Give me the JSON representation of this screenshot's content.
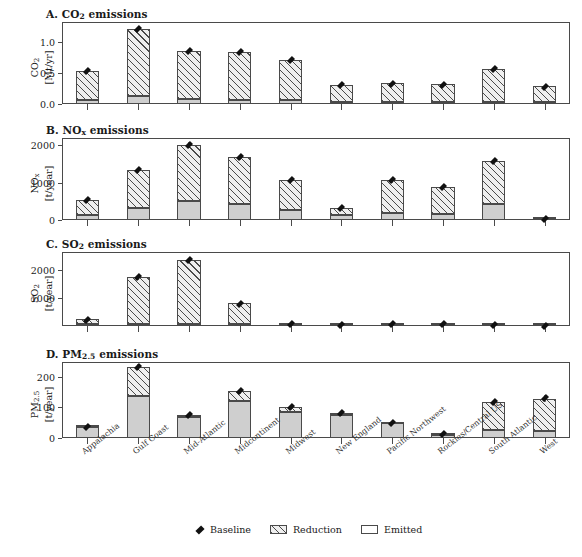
{
  "figure": {
    "categories": [
      "Appalachia",
      "Gulf Coast",
      "Mid-Atlantic",
      "Midcontinent",
      "Midwest",
      "New England",
      "Pacific Northwest",
      "Rockies/Central US",
      "South Atlantic",
      "West"
    ],
    "legend": {
      "baseline_label": "Baseline",
      "reduction_label": "Reduction",
      "emitted_label": "Emitted"
    },
    "colors": {
      "emitted": "#cfcfcf",
      "reduction_hatch": "#4a4a4a",
      "baseline_marker": "#111111",
      "axis": "#4a4a4a"
    }
  },
  "chart_data": [
    {
      "type": "bar",
      "panel": "A",
      "title_prefix": "A.",
      "title_species": "CO",
      "title_species_sub": "2",
      "title_suffix": "emissions",
      "ylabel_species": "CO",
      "ylabel_species_sub": "2",
      "ylabel_units": "[Mt/yr]",
      "categories": [
        "Appalachia",
        "Gulf Coast",
        "Mid-Atlantic",
        "Midcontinent",
        "Midwest",
        "New England",
        "Pacific Northwest",
        "Rockies/Central US",
        "South Atlantic",
        "West"
      ],
      "yticks": [
        0.0,
        0.5,
        1.0
      ],
      "ytick_labels": [
        "0.0",
        "0.5",
        "1.0"
      ],
      "ylim": [
        0,
        1.32
      ],
      "series": [
        {
          "name": "Emitted",
          "values": [
            0.06,
            0.13,
            0.08,
            0.07,
            0.07,
            0.02,
            0.02,
            0.02,
            0.04,
            0.02
          ]
        },
        {
          "name": "Reduction",
          "values": [
            0.47,
            1.08,
            0.78,
            0.76,
            0.64,
            0.28,
            0.31,
            0.29,
            0.52,
            0.26
          ]
        }
      ],
      "baseline": [
        0.53,
        1.21,
        0.86,
        0.83,
        0.71,
        0.3,
        0.33,
        0.31,
        0.56,
        0.28
      ],
      "baseline_err": [
        0.025,
        0.03,
        0.03,
        0.03,
        0.025,
        0.02,
        0.02,
        0.02,
        0.025,
        0.02
      ],
      "grid": false
    },
    {
      "type": "bar",
      "panel": "B",
      "title_prefix": "B.",
      "title_species": "NO",
      "title_species_sub": "x",
      "title_suffix": "emissions",
      "ylabel_species": "NO",
      "ylabel_species_sub": "x",
      "ylabel_units": "[t/year]",
      "categories": [
        "Appalachia",
        "Gulf Coast",
        "Mid-Atlantic",
        "Midcontinent",
        "Midwest",
        "New England",
        "Pacific Northwest",
        "Rockies/Central US",
        "South Atlantic",
        "West"
      ],
      "yticks": [
        0,
        1000,
        2000
      ],
      "ytick_labels": [
        "0",
        "1000",
        "2000"
      ],
      "ylim": [
        0,
        2200
      ],
      "series": [
        {
          "name": "Emitted",
          "values": [
            140,
            330,
            520,
            440,
            270,
            140,
            200,
            160,
            420,
            5
          ]
        },
        {
          "name": "Reduction",
          "values": [
            410,
            1000,
            1490,
            1240,
            800,
            180,
            860,
            730,
            1150,
            10
          ]
        }
      ],
      "baseline": [
        550,
        1330,
        2010,
        1680,
        1070,
        320,
        1060,
        890,
        1570,
        15
      ],
      "baseline_err": [
        45,
        60,
        70,
        70,
        50,
        35,
        55,
        45,
        65,
        20
      ],
      "grid": false
    },
    {
      "type": "bar",
      "panel": "C",
      "title_prefix": "C.",
      "title_species": "SO",
      "title_species_sub": "2",
      "title_suffix": "emissions",
      "ylabel_species": "SO",
      "ylabel_species_sub": "2",
      "ylabel_units": "[t/year]",
      "categories": [
        "Appalachia",
        "Gulf Coast",
        "Mid-Atlantic",
        "Midcontinent",
        "Midwest",
        "New England",
        "Pacific Northwest",
        "Rockies/Central US",
        "South Atlantic",
        "West"
      ],
      "yticks": [
        1000,
        2000
      ],
      "ytick_labels": [
        "1000",
        "2000"
      ],
      "ylim": [
        0,
        2650
      ],
      "series": [
        {
          "name": "Emitted",
          "values": [
            30,
            40,
            40,
            25,
            10,
            8,
            15,
            20,
            12,
            3
          ]
        },
        {
          "name": "Reduction",
          "values": [
            200,
            1700,
            2320,
            780,
            55,
            10,
            40,
            45,
            28,
            5
          ]
        }
      ],
      "baseline": [
        230,
        1740,
        2360,
        805,
        65,
        18,
        55,
        65,
        40,
        8
      ],
      "baseline_err": [
        55,
        85,
        90,
        70,
        25,
        15,
        20,
        25,
        18,
        12
      ],
      "grid": false
    },
    {
      "type": "bar",
      "panel": "D",
      "title_prefix": "D.",
      "title_species": "PM",
      "title_species_sub": "2.5",
      "title_suffix": "emissions",
      "ylabel_species": "PM",
      "ylabel_species_sub": "2.5",
      "ylabel_units": "[t/year]",
      "categories": [
        "Appalachia",
        "Gulf Coast",
        "Mid-Atlantic",
        "Midcontinent",
        "Midwest",
        "New England",
        "Pacific Northwest",
        "Rockies/Central US",
        "South Atlantic",
        "West"
      ],
      "yticks": [
        0,
        100,
        200
      ],
      "ytick_labels": [
        "0",
        "100",
        "200"
      ],
      "ylim": [
        0,
        248
      ],
      "series": [
        {
          "name": "Emitted",
          "values": [
            36,
            137,
            70,
            120,
            86,
            75,
            48,
            10,
            25,
            22,
            10
          ]
        },
        {
          "name": "Reduction",
          "values": [
            2,
            96,
            5,
            33,
            14,
            5,
            2,
            2,
            92,
            106,
            3
          ]
        }
      ],
      "baseline": [
        37,
        233,
        74,
        152,
        100,
        80,
        50,
        12,
        116,
        129,
        13
      ],
      "baseline_err": [
        7,
        10,
        7,
        9,
        8,
        8,
        6,
        5,
        9,
        10,
        6
      ],
      "grid": false
    }
  ]
}
